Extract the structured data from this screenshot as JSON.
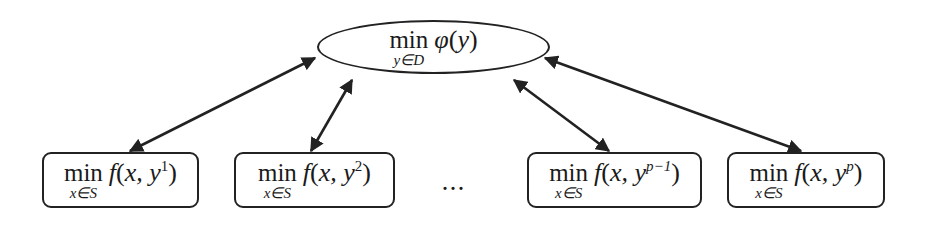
{
  "diagram": {
    "type": "hierarchical-decomposition",
    "colors": {
      "stroke": "#222222",
      "text": "#1a1a1a",
      "background": "#ffffff"
    },
    "master": {
      "operator": "min",
      "subscript": "y∈D",
      "function": "φ",
      "argument": "y",
      "full_text": "min_{y∈D} φ(y)"
    },
    "subproblems": [
      {
        "operator": "min",
        "subscript": "x∈S",
        "function": "f",
        "args": "x, y",
        "superscript": "1",
        "full_text": "min_{x∈S} f(x, y^1)"
      },
      {
        "operator": "min",
        "subscript": "x∈S",
        "function": "f",
        "args": "x, y",
        "superscript": "2",
        "full_text": "min_{x∈S} f(x, y^2)"
      },
      {
        "operator": "min",
        "subscript": "x∈S",
        "function": "f",
        "args": "x, y",
        "superscript": "p−1",
        "full_text": "min_{x∈S} f(x, y^{p−1})"
      },
      {
        "operator": "min",
        "subscript": "x∈S",
        "function": "f",
        "args": "x, y",
        "superscript": "p",
        "full_text": "min_{x∈S} f(x, y^p)"
      }
    ],
    "ellipsis": "…",
    "edges": [
      {
        "from": "master",
        "to": "subproblem-1",
        "direction": "bidirectional"
      },
      {
        "from": "master",
        "to": "subproblem-2",
        "direction": "bidirectional"
      },
      {
        "from": "master",
        "to": "subproblem-3",
        "direction": "bidirectional"
      },
      {
        "from": "master",
        "to": "subproblem-4",
        "direction": "bidirectional"
      }
    ]
  }
}
